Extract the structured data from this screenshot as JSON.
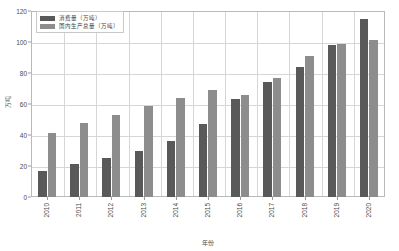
{
  "chart_data": {
    "type": "bar",
    "title": "",
    "subtitle": "",
    "xlabel": "年份",
    "ylabel": "万吨",
    "ylim": [
      0,
      120
    ],
    "yticks": [
      0,
      20,
      40,
      60,
      80,
      100,
      120
    ],
    "ytick_labels": [
      "0",
      "20",
      "40",
      "60",
      "80",
      "100",
      "120"
    ],
    "grid": true,
    "legend_position": "upper-left",
    "categories": [
      "2010",
      "2011",
      "2012",
      "2013",
      "2014",
      "2015",
      "2016",
      "2017",
      "2018",
      "2019",
      "2020"
    ],
    "series": [
      {
        "name": "消费量（万吨）",
        "color": "#595959",
        "values": [
          17,
          21,
          25,
          30,
          36,
          47,
          63,
          74,
          84,
          98,
          115
        ]
      },
      {
        "name": "国内生产总量（万吨）",
        "color": "#8d8d8d",
        "values": [
          41,
          48,
          53,
          59,
          64,
          69,
          66,
          77,
          91,
          99,
          101
        ]
      }
    ]
  },
  "legend": {
    "entries": [
      {
        "label": "消费量（万吨）",
        "swatch": "consumption"
      },
      {
        "label": "国内生产总量（万吨）",
        "swatch": "production"
      }
    ]
  },
  "axes": {
    "y_title": "万吨",
    "x_title": "年份"
  },
  "colors": {
    "consumption": "#595959",
    "production": "#8d8d8d",
    "grid": "#d6d6d6",
    "frame": "#b9b9b9",
    "text": "#4a4a4a"
  }
}
